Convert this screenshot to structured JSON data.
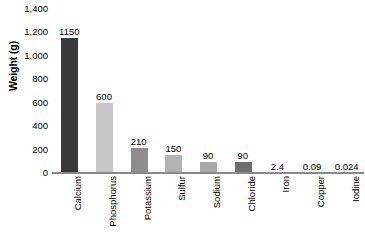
{
  "chart_data": {
    "type": "bar",
    "title": "",
    "subtitle": "",
    "xlabel": "",
    "ylabel": "Weight (g)",
    "ylim": [
      0,
      1400
    ],
    "ytick_step": 200,
    "grid": false,
    "legend": "none",
    "categories": [
      "Calcium",
      "Phosphorus",
      "Potassium",
      "Sulfur",
      "Sodium",
      "Chloride",
      "Iron",
      "Copper",
      "Iodine"
    ],
    "values": [
      1150,
      600,
      210,
      150,
      90,
      90,
      2.4,
      0.09,
      0.024
    ],
    "value_labels": [
      "1150",
      "600",
      "210",
      "150",
      "90",
      "90",
      "2.4",
      "0.09",
      "0.024"
    ],
    "bar_colors": [
      "#3a3a3a",
      "#c6c6c6",
      "#8e8e8e",
      "#b3b3b3",
      "#a8a8a8",
      "#6e6e6e",
      "#9a9a9a",
      "#9a9a9a",
      "#9a9a9a"
    ],
    "ytick_labels": [
      "1,400",
      "1,200",
      "1,000",
      "800",
      "600",
      "400",
      "200",
      "0"
    ],
    "ytick_values": [
      1400,
      1200,
      1000,
      800,
      600,
      400,
      200,
      0
    ],
    "axis_color": "#8a8a8a",
    "text_color": "#000000",
    "background_color": "#ffffff"
  }
}
